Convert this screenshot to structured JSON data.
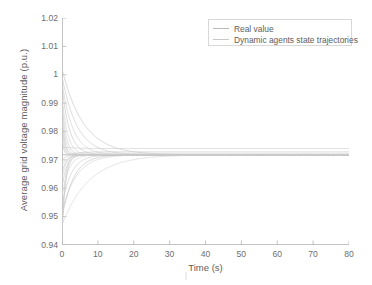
{
  "chart_data": {
    "type": "line",
    "title": "",
    "xlabel": "Time (s)",
    "ylabel": "Average grid voltage magnitude (p.u.)",
    "xlim": [
      0,
      80
    ],
    "ylim": [
      0.94,
      1.02
    ],
    "xticks": [
      0,
      10,
      20,
      30,
      40,
      50,
      60,
      70,
      80
    ],
    "xtick_labels": [
      "0",
      "10",
      "20",
      "30",
      "40",
      "50",
      "60",
      "70",
      "80"
    ],
    "yticks": [
      0.94,
      0.95,
      0.96,
      0.97,
      0.98,
      0.99,
      1.0,
      1.01,
      1.02
    ],
    "ytick_labels": [
      "0.94",
      "0.95",
      "0.96",
      "0.97",
      "0.98",
      "0.99",
      "1",
      "1.01",
      "1.02"
    ],
    "grid": false,
    "legend_position": "upper right",
    "legend": [
      {
        "label": "Real value",
        "color": "#b9b9b9"
      },
      {
        "label": "Dynamic agents state trajectories",
        "color": "#c9c9c9"
      }
    ],
    "steady_state_value": 0.9718,
    "series": [
      {
        "name": "Real value",
        "color": "#b0b0b0",
        "start": 0.9718,
        "end": 0.9718,
        "tau": 1.0
      },
      {
        "name": "agent-1",
        "color": "#c4c4c4",
        "start": 1.002,
        "end": 0.9718,
        "tau": 6.0
      },
      {
        "name": "agent-2",
        "color": "#c9c9c9",
        "start": 0.9995,
        "end": 0.9718,
        "tau": 4.2
      },
      {
        "name": "agent-3",
        "color": "#cfcfcf",
        "start": 0.9975,
        "end": 0.9718,
        "tau": 3.0
      },
      {
        "name": "agent-4",
        "color": "#c6c6c6",
        "start": 0.996,
        "end": 0.9718,
        "tau": 2.1
      },
      {
        "name": "agent-5",
        "color": "#d2d2d2",
        "start": 0.993,
        "end": 0.9718,
        "tau": 1.5
      },
      {
        "name": "agent-6",
        "color": "#cccccc",
        "start": 0.9905,
        "end": 0.9718,
        "tau": 1.1
      },
      {
        "name": "agent-7",
        "color": "#d5d5d5",
        "start": 0.988,
        "end": 0.9718,
        "tau": 0.9
      },
      {
        "name": "agent-8",
        "color": "#c2c2c2",
        "start": 0.986,
        "end": 0.9718,
        "tau": 0.7
      },
      {
        "name": "agent-9",
        "color": "#d0d0d0",
        "start": 0.9835,
        "end": 0.9718,
        "tau": 0.6
      },
      {
        "name": "agent-10",
        "color": "#c8c8c8",
        "start": 0.98,
        "end": 0.9718,
        "tau": 0.5
      },
      {
        "name": "agent-11",
        "color": "#cfcfcf",
        "start": 0.977,
        "end": 0.9718,
        "tau": 0.45
      },
      {
        "name": "agent-12",
        "color": "#cacaca",
        "start": 0.9745,
        "end": 0.974,
        "tau": 3.5
      },
      {
        "name": "agent-13",
        "color": "#c5c5c5",
        "start": 0.97,
        "end": 0.9728,
        "tau": 2.2
      },
      {
        "name": "agent-14",
        "color": "#d3d3d3",
        "start": 0.968,
        "end": 0.9722,
        "tau": 1.6
      },
      {
        "name": "agent-15",
        "color": "#c9c9c9",
        "start": 0.9655,
        "end": 0.9718,
        "tau": 1.2
      },
      {
        "name": "agent-16",
        "color": "#d1d1d1",
        "start": 0.963,
        "end": 0.9718,
        "tau": 1.1
      },
      {
        "name": "agent-17",
        "color": "#c7c7c7",
        "start": 0.96,
        "end": 0.9718,
        "tau": 1.3
      },
      {
        "name": "agent-18",
        "color": "#d4d4d4",
        "start": 0.957,
        "end": 0.9718,
        "tau": 1.8
      },
      {
        "name": "agent-19",
        "color": "#cbcbcb",
        "start": 0.954,
        "end": 0.9718,
        "tau": 2.6
      },
      {
        "name": "agent-20",
        "color": "#d0d0d0",
        "start": 0.9515,
        "end": 0.9718,
        "tau": 4.0
      },
      {
        "name": "agent-21",
        "color": "#c3c3c3",
        "start": 0.9495,
        "end": 0.9718,
        "tau": 3.2
      },
      {
        "name": "agent-22",
        "color": "#d6d6d6",
        "start": 0.947,
        "end": 0.9718,
        "tau": 7.5
      },
      {
        "name": "agent-23",
        "color": "#cecece",
        "start": 0.944,
        "end": 0.9718,
        "tau": 1.0
      },
      {
        "name": "agent-24",
        "color": "#c9c9c9",
        "start": 0.943,
        "end": 0.9718,
        "tau": 0.8
      }
    ]
  },
  "axes": {
    "axis_color": "#c4c4c4",
    "tick_color": "#b5b5b5",
    "label_color": "#5d5d5d"
  },
  "legend_box": {
    "border_color": "#d8d8d8",
    "background": "#ffffff"
  }
}
